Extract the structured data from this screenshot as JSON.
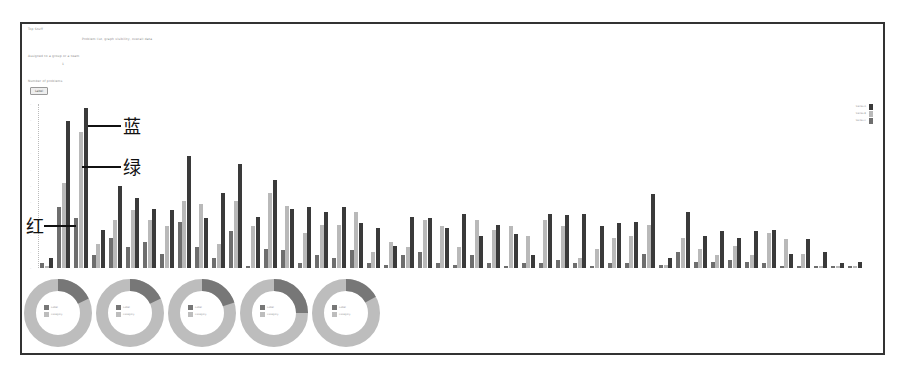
{
  "page": {
    "header_small": "Top Stuff",
    "subtitle": "Problem list, graph visibility, overall data",
    "line2": "Assigned to a group or a team",
    "line2_value": "1",
    "line3": "Number of problems",
    "button_label": "Label"
  },
  "annotations": {
    "blue": "蓝",
    "green": "绿",
    "red": "红"
  },
  "colors": {
    "red_series": "#6e6e6e",
    "green_series": "#b9b9b9",
    "blue_series": "#3a3a3a",
    "donut_main": "#bdbdbd",
    "donut_slice": "#777777",
    "frame": "#333333"
  },
  "chart_data": [
    {
      "type": "bar",
      "title": "",
      "xlabel": "",
      "ylabel": "",
      "ylim": [
        0,
        100
      ],
      "grid": false,
      "legend_position": "top-right",
      "legend": [
        "Series A",
        "Series B",
        "Series C"
      ],
      "categories": [
        "c1",
        "c2",
        "c3",
        "c4",
        "c5",
        "c6",
        "c7",
        "c8",
        "c9",
        "c10",
        "c11",
        "c12",
        "c13",
        "c14",
        "c15",
        "c16",
        "c17",
        "c18",
        "c19",
        "c20",
        "c21",
        "c22",
        "c23",
        "c24",
        "c25",
        "c26",
        "c27",
        "c28",
        "c29",
        "c30",
        "c31",
        "c32",
        "c33",
        "c34",
        "c35",
        "c36",
        "c37",
        "c38",
        "c39",
        "c40",
        "c41",
        "c42",
        "c43",
        "c44",
        "c45",
        "c46",
        "c47",
        "c48"
      ],
      "series": [
        {
          "name": "红 (red)",
          "values": [
            3,
            38,
            31,
            8,
            19,
            13,
            16,
            9,
            29,
            13,
            6,
            23,
            1,
            12,
            11,
            3,
            8,
            6,
            11,
            3,
            2,
            8,
            10,
            3,
            2,
            8,
            3,
            1,
            3,
            3,
            5,
            3,
            1,
            3,
            3,
            9,
            2,
            10,
            4,
            4,
            5,
            4,
            3,
            1,
            1,
            1,
            1,
            1
          ]
        },
        {
          "name": "绿 (green)",
          "values": [
            1,
            53,
            85,
            15,
            30,
            36,
            30,
            26,
            42,
            40,
            15,
            42,
            26,
            47,
            39,
            22,
            27,
            27,
            35,
            10,
            16,
            13,
            30,
            26,
            13,
            30,
            24,
            26,
            20,
            30,
            26,
            6,
            12,
            19,
            20,
            27,
            2,
            19,
            12,
            8,
            14,
            8,
            22,
            18,
            9,
            1,
            1,
            1
          ]
        },
        {
          "name": "蓝 (blue)",
          "values": [
            6,
            92,
            100,
            24,
            51,
            44,
            37,
            36,
            70,
            31,
            47,
            65,
            32,
            55,
            37,
            38,
            35,
            38,
            28,
            25,
            14,
            32,
            31,
            25,
            34,
            20,
            27,
            21,
            8,
            34,
            33,
            34,
            26,
            28,
            29,
            46,
            6,
            35,
            20,
            23,
            19,
            23,
            24,
            9,
            18,
            10,
            3,
            4
          ]
        }
      ]
    },
    {
      "type": "pie",
      "donut": true,
      "charts": [
        {
          "slices": [
            {
              "label": "Label",
              "value": 18
            },
            {
              "label": "Category",
              "value": 82
            }
          ]
        },
        {
          "slices": [
            {
              "label": "Label",
              "value": 18
            },
            {
              "label": "Category",
              "value": 82
            }
          ]
        },
        {
          "slices": [
            {
              "label": "Label",
              "value": 20
            },
            {
              "label": "Category",
              "value": 80
            }
          ]
        },
        {
          "slices": [
            {
              "label": "Label",
              "value": 25
            },
            {
              "label": "Category",
              "value": 75
            }
          ]
        },
        {
          "slices": [
            {
              "label": "Label",
              "value": 17
            },
            {
              "label": "Category",
              "value": 83
            }
          ]
        }
      ]
    }
  ]
}
